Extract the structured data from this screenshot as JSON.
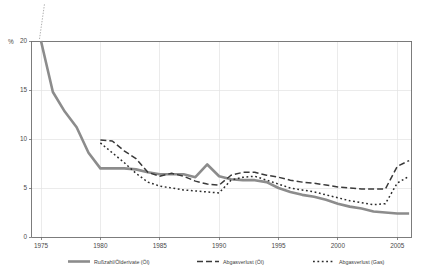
{
  "chart_data": {
    "type": "line",
    "title": "",
    "subtitle": "",
    "xlabel": "",
    "ylabel": "",
    "y_unit": "%",
    "xlim": [
      1974.2,
      2006.2
    ],
    "ylim": [
      0,
      20
    ],
    "yticks": [
      0,
      5,
      10,
      15,
      20
    ],
    "ytick_labels": [
      "0",
      "5",
      "10",
      "15",
      "20"
    ],
    "xticks": [
      1975,
      1980,
      1985,
      1990,
      1995,
      2000,
      2005
    ],
    "xtick_labels": [
      "1975",
      "1980",
      "1985",
      "1990",
      "1995",
      "2000",
      "2005"
    ],
    "grid": "horizontal-and-vertical-light",
    "axis_break_top": true,
    "legend_position": "bottom",
    "series": [
      {
        "name": "Rußzahl/Ölderivate (Öl)",
        "style": "solid",
        "color": "#8c8c8c",
        "width": 2.6,
        "x": [
          1975,
          1976,
          1977,
          1978,
          1979,
          1980,
          1981,
          1982,
          1983,
          1984,
          1985,
          1986,
          1987,
          1988,
          1989,
          1990,
          1991,
          1992,
          1993,
          1994,
          1995,
          1996,
          1997,
          1998,
          1999,
          2000,
          2001,
          2002,
          2003,
          2004,
          2005,
          2006
        ],
        "values": [
          20.0,
          14.8,
          12.8,
          11.2,
          8.6,
          7.0,
          7.0,
          7.0,
          6.9,
          6.6,
          6.4,
          6.4,
          6.4,
          6.1,
          7.4,
          6.2,
          5.9,
          5.8,
          5.8,
          5.6,
          5.0,
          4.6,
          4.3,
          4.1,
          3.8,
          3.4,
          3.1,
          2.9,
          2.6,
          2.5,
          2.4,
          2.4
        ]
      },
      {
        "name": "Abgasverlust (Öl)",
        "style": "dashed",
        "color": "#3a3a3a",
        "width": 1.5,
        "dash": "6 3",
        "x": [
          1980,
          1981,
          1982,
          1983,
          1984,
          1985,
          1986,
          1987,
          1988,
          1989,
          1990,
          1991,
          1992,
          1993,
          1994,
          1995,
          1996,
          1997,
          1998,
          1999,
          2000,
          2001,
          2002,
          2003,
          2004,
          2005,
          2006
        ],
        "values": [
          9.9,
          9.8,
          8.8,
          8.0,
          6.6,
          6.2,
          6.5,
          6.2,
          5.7,
          5.4,
          5.3,
          6.3,
          6.6,
          6.6,
          6.3,
          6.1,
          5.8,
          5.6,
          5.5,
          5.3,
          5.1,
          5.0,
          4.9,
          4.9,
          4.9,
          7.2,
          7.8
        ]
      },
      {
        "name": "Abgasverlust (Gas)",
        "style": "dotted",
        "color": "#2b2b2b",
        "width": 1.5,
        "dash": "1.8 2.6",
        "x": [
          1980,
          1981,
          1982,
          1983,
          1984,
          1985,
          1986,
          1987,
          1988,
          1989,
          1990,
          1991,
          1992,
          1993,
          1994,
          1995,
          1996,
          1997,
          1998,
          1999,
          2000,
          2001,
          2002,
          2003,
          2004,
          2005,
          2006
        ],
        "values": [
          9.6,
          8.6,
          7.6,
          6.5,
          5.6,
          5.2,
          5.0,
          4.8,
          4.7,
          4.6,
          4.5,
          5.8,
          6.1,
          6.2,
          5.8,
          5.4,
          5.0,
          4.8,
          4.6,
          4.3,
          4.0,
          3.7,
          3.5,
          3.3,
          3.4,
          5.5,
          6.2
        ]
      }
    ]
  },
  "legend": {
    "items": [
      {
        "label": "Rußzahl/Ölderivate (Öl)"
      },
      {
        "label": "Abgasverlust (Öl)"
      },
      {
        "label": "Abgasverlust (Gas)"
      }
    ]
  }
}
